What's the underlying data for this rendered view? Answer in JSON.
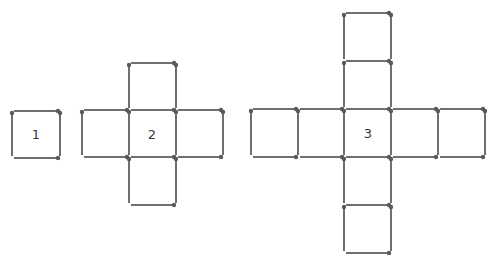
{
  "diagram": {
    "stick_color": "#6f6f6f",
    "head_color": "#5a5a5a",
    "figures": [
      {
        "id": "figure-1",
        "label": "1",
        "label_pos": [
          36,
          134
        ],
        "cols": [
          12,
          60
        ],
        "rows": [
          111,
          158
        ],
        "squares": [
          [
            0,
            0
          ]
        ]
      },
      {
        "id": "figure-2",
        "label": "2",
        "label_pos": [
          152,
          134
        ],
        "cols": [
          82,
          129,
          176,
          223
        ],
        "rows": [
          63,
          110,
          157,
          205
        ],
        "squares": [
          [
            1,
            0
          ],
          [
            0,
            1
          ],
          [
            1,
            1
          ],
          [
            2,
            1
          ],
          [
            1,
            2
          ]
        ]
      },
      {
        "id": "figure-3",
        "label": "3",
        "label_pos": [
          368,
          133
        ],
        "cols": [
          251,
          298,
          344,
          391,
          438,
          485
        ],
        "rows": [
          13,
          61,
          109,
          157,
          205,
          253
        ],
        "squares": [
          [
            2,
            0
          ],
          [
            2,
            1
          ],
          [
            0,
            2
          ],
          [
            1,
            2
          ],
          [
            2,
            2
          ],
          [
            3,
            2
          ],
          [
            4,
            2
          ],
          [
            2,
            3
          ],
          [
            2,
            4
          ]
        ]
      }
    ]
  }
}
